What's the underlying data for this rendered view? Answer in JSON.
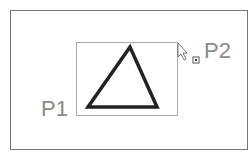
{
  "labels": {
    "p1": "P1",
    "p2": "P2"
  },
  "shapes": {
    "triangle": {
      "points": "88,107 130,47 157,107",
      "stroke": "#222222"
    }
  },
  "icons": {
    "cursor": "arrow-cursor-icon",
    "snap": "snap-point-icon"
  }
}
